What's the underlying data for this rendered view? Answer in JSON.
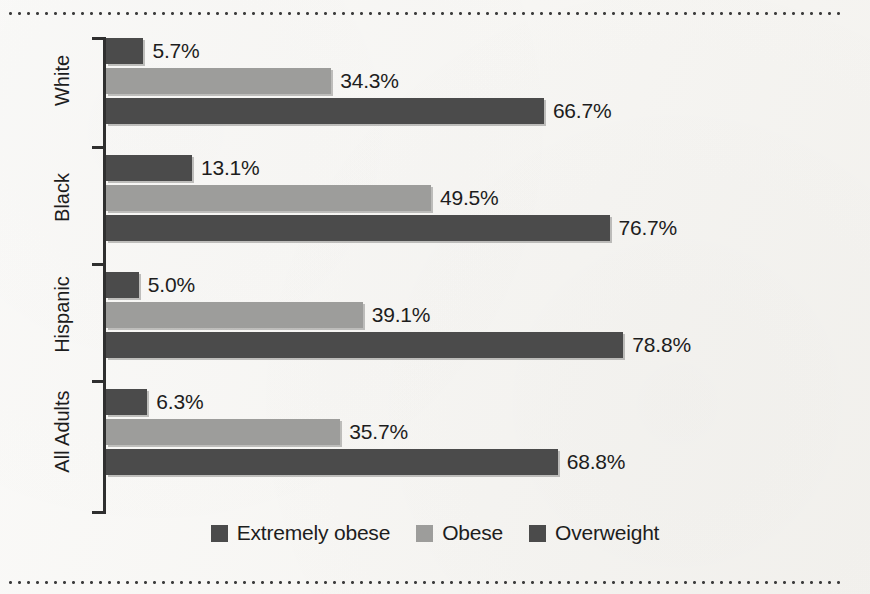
{
  "chart_data": {
    "type": "bar",
    "orientation": "horizontal",
    "title": "",
    "subtitle": "",
    "xlabel": "",
    "ylabel": "",
    "grid": false,
    "legend_position": "bottom-center",
    "xlim": [
      0,
      78.8
    ],
    "value_suffix": "%",
    "categories": [
      "White",
      "Black",
      "Hispanic",
      "All Adults"
    ],
    "series": [
      {
        "name": "Extremely obese",
        "color": "#4b4b4b",
        "values": [
          5.7,
          13.1,
          5.0,
          6.3
        ],
        "labels": [
          "5.7%",
          "13.1%",
          "5.0%",
          "6.3%"
        ]
      },
      {
        "name": "Obese",
        "color": "#9d9d9b",
        "values": [
          34.3,
          49.5,
          39.1,
          35.7
        ],
        "labels": [
          "34.3%",
          "49.5%",
          "39.1%",
          "35.7%"
        ]
      },
      {
        "name": "Overweight",
        "color": "#4b4b4b",
        "values": [
          66.7,
          76.7,
          78.8,
          68.8
        ],
        "labels": [
          "66.7%",
          "76.7%",
          "78.8%",
          "68.8%"
        ]
      }
    ]
  },
  "legend": {
    "items": [
      {
        "label": "Extremely obese",
        "swatch": "dark"
      },
      {
        "label": "Obese",
        "swatch": "light"
      },
      {
        "label": "Overweight",
        "swatch": "dark"
      }
    ]
  },
  "axis": {
    "category_labels": [
      "White",
      "Black",
      "Hispanic",
      "All Adults"
    ]
  },
  "colors": {
    "background": "#f6f5f2",
    "dark_bar": "#4b4b4b",
    "light_bar": "#9d9d9b",
    "text": "#1d1d1d",
    "axis": "#2f2f2f",
    "rule": "#3d3d3d"
  }
}
